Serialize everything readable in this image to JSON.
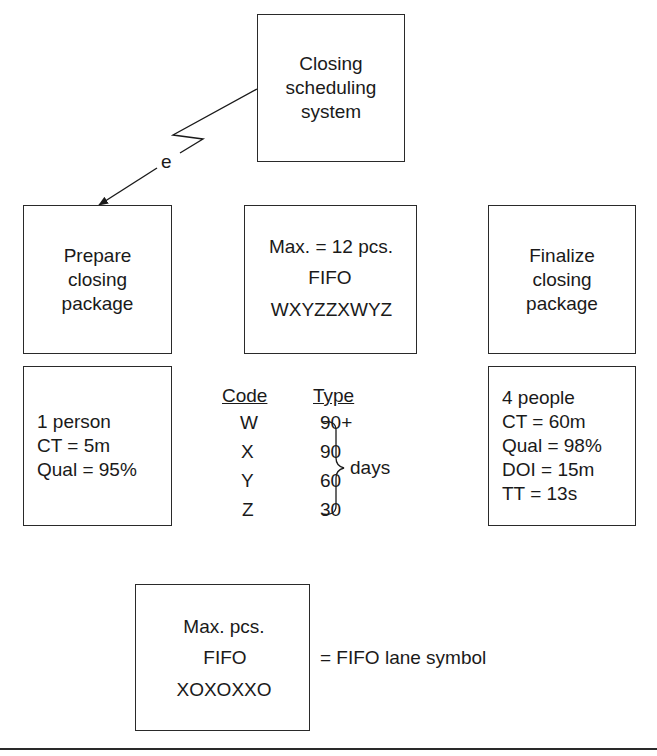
{
  "system_box": {
    "lines": [
      "Closing",
      "scheduling",
      "system"
    ]
  },
  "electronic_link_label": "e",
  "process_boxes": [
    {
      "lines": [
        "Prepare",
        "closing",
        "package"
      ]
    },
    {
      "lines": [
        "Finalize",
        "closing",
        "package"
      ]
    }
  ],
  "fifo_lane": {
    "max_label": "Max. = 12 pcs.",
    "fifo_label": "FIFO",
    "sequence": "WXYZZXWYZ"
  },
  "data_boxes": [
    {
      "lines": [
        "1 person",
        "CT = 5m",
        "Qual = 95%"
      ]
    },
    {
      "lines": [
        "4 people",
        "CT = 60m",
        "Qual = 98%",
        "DOI = 15m",
        "TT = 13s"
      ]
    }
  ],
  "code_table": {
    "headers": [
      "Code",
      "Type"
    ],
    "rows": [
      {
        "code": "W",
        "type": "90+"
      },
      {
        "code": "X",
        "type": "90"
      },
      {
        "code": "Y",
        "type": "60"
      },
      {
        "code": "Z",
        "type": "30"
      }
    ],
    "brace_label": "days"
  },
  "legend": {
    "max_label": "Max. pcs.",
    "fifo_label": "FIFO",
    "sequence": "XOXOXXO",
    "description": "= FIFO lane symbol"
  }
}
